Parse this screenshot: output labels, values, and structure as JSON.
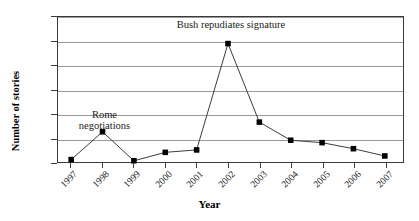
{
  "chart_data": {
    "type": "line",
    "title": "",
    "xlabel": "Year",
    "ylabel": "Number of stories",
    "categories": [
      "1997",
      "1998",
      "1999",
      "2000",
      "2001",
      "2002",
      "2003",
      "2004",
      "2005",
      "2006",
      "2007"
    ],
    "values": [
      2,
      25,
      1,
      8,
      10,
      98,
      33,
      18,
      16,
      11,
      5
    ],
    "series": [
      {
        "name": "Number of stories",
        "values": [
          2,
          25,
          1,
          8,
          10,
          98,
          33,
          18,
          16,
          11,
          5
        ]
      }
    ],
    "ylim": [
      0,
      120
    ],
    "ytick_step": 20,
    "yticks": [
      0,
      20,
      40,
      60,
      80,
      100,
      120
    ],
    "ytick_labels": [
      "0",
      "20",
      "40",
      "60",
      "80",
      "100",
      "120"
    ],
    "grid": "horizontal",
    "legend": "none",
    "marker": "square",
    "marker_color": "#000000",
    "line_color": "#3a3a3a",
    "gridline_color": "#9a9a9a",
    "axis_color": "#3a3a3a",
    "background": "#ffffff",
    "xtick_rotation": -45,
    "annotations": [
      {
        "id": "bush",
        "text": "Bush repudiates signature",
        "lines": [
          "Bush repudiates signature"
        ],
        "near_category": "2002"
      },
      {
        "id": "rome",
        "text": "Rome negotiations",
        "lines": [
          "Rome",
          "negotiations"
        ],
        "near_category": "1998"
      }
    ]
  }
}
